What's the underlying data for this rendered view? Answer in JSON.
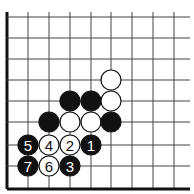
{
  "diagram": {
    "type": "go-board-corner",
    "caption_partial": "",
    "grid": {
      "cols_x": [
        7,
        28,
        49,
        70,
        91,
        111,
        132,
        153,
        174
      ],
      "rows_y": [
        17,
        38,
        59,
        80,
        101,
        122,
        145,
        166,
        189
      ],
      "right_extent": 190,
      "top_extent": 12,
      "edges": [
        "left",
        "bottom"
      ]
    },
    "colors": {
      "black": "#111111",
      "white": "#ffffff",
      "line": "#444444"
    },
    "stones": [
      {
        "color": "white",
        "col": 5,
        "row": 3,
        "label": ""
      },
      {
        "color": "black",
        "col": 3,
        "row": 4,
        "label": ""
      },
      {
        "color": "black",
        "col": 4,
        "row": 4,
        "label": ""
      },
      {
        "color": "white",
        "col": 5,
        "row": 4,
        "label": ""
      },
      {
        "color": "black",
        "col": 2,
        "row": 5,
        "label": ""
      },
      {
        "color": "white",
        "col": 3,
        "row": 5,
        "label": ""
      },
      {
        "color": "white",
        "col": 4,
        "row": 5,
        "label": ""
      },
      {
        "color": "black",
        "col": 5,
        "row": 5,
        "label": ""
      },
      {
        "color": "black",
        "col": 1,
        "row": 6,
        "label": "5"
      },
      {
        "color": "white",
        "col": 2,
        "row": 6,
        "label": "4"
      },
      {
        "color": "white",
        "col": 3,
        "row": 6,
        "label": "2"
      },
      {
        "color": "black",
        "col": 4,
        "row": 6,
        "label": "1"
      },
      {
        "color": "black",
        "col": 1,
        "row": 7,
        "label": "7"
      },
      {
        "color": "white",
        "col": 2,
        "row": 7,
        "label": "6"
      },
      {
        "color": "black",
        "col": 3,
        "row": 7,
        "label": "3"
      }
    ]
  }
}
